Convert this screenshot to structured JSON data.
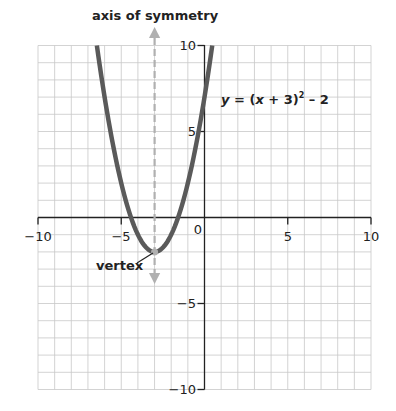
{
  "chart_data": {
    "type": "line",
    "title": "axis of symmetry",
    "equation": "y = (x + 3)² – 2",
    "xlabel": "",
    "ylabel": "",
    "xlim": [
      -10,
      10
    ],
    "ylim": [
      -10,
      10
    ],
    "grid": true,
    "x_ticks": [
      "−10",
      "−5",
      "0",
      "5",
      "10"
    ],
    "y_ticks": [
      "10",
      "5",
      "−5",
      "−10"
    ],
    "series": [
      {
        "name": "y = (x + 3)^2 - 2",
        "x": [
          -6.464,
          -6,
          -5,
          -4,
          -3,
          -2,
          -1,
          0.464
        ],
        "y": [
          10,
          7,
          2,
          -1,
          -2,
          -1,
          2,
          10
        ]
      }
    ],
    "annotations": [
      {
        "text": "axis of symmetry",
        "x": -3,
        "type": "dashed-vertical-line"
      },
      {
        "text": "vertex",
        "x": -3,
        "y": -2
      }
    ]
  },
  "labels": {
    "title": "axis of symmetry",
    "eq_y": "y",
    "eq_mid": " = (",
    "eq_x": "x",
    "eq_rest": " + 3)",
    "eq_sup": "2",
    "eq_tail": " – 2",
    "vertex": "vertex",
    "xt_m10": "−10",
    "xt_m5": "−5",
    "xt_0": "0",
    "xt_5": "5",
    "xt_10": "10",
    "yt_10": "10",
    "yt_5": "5",
    "yt_m5": "−5",
    "yt_m10": "−10"
  },
  "colors": {
    "curve": "#5a5a5a",
    "axis": "#222222",
    "grid": "#c8c8c8",
    "symmetry": "#b0b0b0"
  }
}
